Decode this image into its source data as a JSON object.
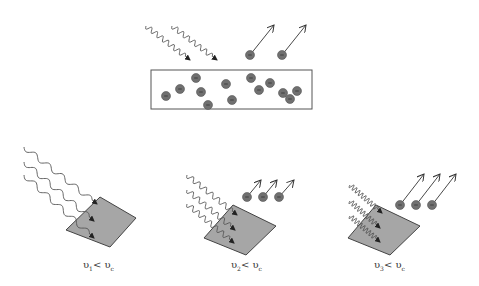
{
  "colors": {
    "wave": "#555555",
    "electron_fill": "#707070",
    "electron_edge": "#555555",
    "plate_fill": "#a6a6a6",
    "plate_edge": "#444444",
    "box_edge": "#555555",
    "arrow": "#333333"
  },
  "top_panel": {
    "box": {
      "x": 151,
      "y": 70,
      "w": 161,
      "h": 39
    },
    "electrons_in_box": [
      [
        166,
        96
      ],
      [
        180,
        89
      ],
      [
        196,
        78
      ],
      [
        201,
        92
      ],
      [
        208,
        105
      ],
      [
        226,
        84
      ],
      [
        232,
        100
      ],
      [
        251,
        78
      ],
      [
        259,
        90
      ],
      [
        270,
        83
      ],
      [
        283,
        93
      ],
      [
        290,
        99
      ],
      [
        297,
        91
      ]
    ],
    "incoming_waves": [
      {
        "x1": 146,
        "y1": 26,
        "x2": 190,
        "y2": 60
      },
      {
        "x1": 172,
        "y1": 26,
        "x2": 217,
        "y2": 60
      }
    ],
    "ejected": [
      {
        "ex": 250,
        "ey": 55,
        "ax": 274,
        "ay": 25
      },
      {
        "ex": 282,
        "ey": 55,
        "ax": 306,
        "ay": 25
      }
    ]
  },
  "panels": [
    {
      "id": "panel-1",
      "label_main": "υ",
      "label_sub": "1",
      "label_rel": "< υ",
      "label_sub2": "c",
      "label_pos": [
        85,
        262
      ],
      "plate": [
        [
          100,
          197
        ],
        [
          136,
          218
        ],
        [
          110,
          247
        ],
        [
          66,
          230
        ]
      ],
      "waves": [
        {
          "x1": 24,
          "y1": 147,
          "x2": 97,
          "y2": 204
        },
        {
          "x1": 24,
          "y1": 162,
          "x2": 94,
          "y2": 221
        },
        {
          "x1": 24,
          "y1": 175,
          "x2": 94,
          "y2": 238
        }
      ],
      "ejected": []
    },
    {
      "id": "panel-2",
      "label_main": "υ",
      "label_sub": "2",
      "label_rel": "< υ",
      "label_sub2": "c",
      "label_pos": [
        233,
        262
      ],
      "plate": [
        [
          233,
          205
        ],
        [
          276,
          226
        ],
        [
          246,
          255
        ],
        [
          204,
          238
        ]
      ],
      "waves": [
        {
          "x1": 187,
          "y1": 175,
          "x2": 237,
          "y2": 215
        },
        {
          "x1": 187,
          "y1": 190,
          "x2": 235,
          "y2": 230
        },
        {
          "x1": 187,
          "y1": 204,
          "x2": 234,
          "y2": 243
        }
      ],
      "ejected": [
        {
          "ex": 247,
          "ey": 197,
          "ax": 261,
          "ay": 180
        },
        {
          "ex": 263,
          "ey": 197,
          "ax": 277,
          "ay": 180
        },
        {
          "ex": 279,
          "ey": 197,
          "ax": 294,
          "ay": 180
        }
      ]
    },
    {
      "id": "panel-3",
      "label_main": "υ",
      "label_sub": "3",
      "label_rel": "< υ",
      "label_sub2": "c",
      "label_pos": [
        376,
        262
      ],
      "plate": [
        [
          376,
          205
        ],
        [
          420,
          226
        ],
        [
          390,
          255
        ],
        [
          348,
          238
        ]
      ],
      "waves": [
        {
          "x1": 350,
          "y1": 185,
          "x2": 382,
          "y2": 213
        },
        {
          "x1": 350,
          "y1": 201,
          "x2": 380,
          "y2": 228
        },
        {
          "x1": 350,
          "y1": 216,
          "x2": 380,
          "y2": 242
        }
      ],
      "ejected": [
        {
          "ex": 400,
          "ey": 205,
          "ax": 424,
          "ay": 174
        },
        {
          "ex": 416,
          "ey": 205,
          "ax": 440,
          "ay": 174
        },
        {
          "ex": 432,
          "ey": 205,
          "ax": 456,
          "ay": 174
        }
      ]
    }
  ]
}
